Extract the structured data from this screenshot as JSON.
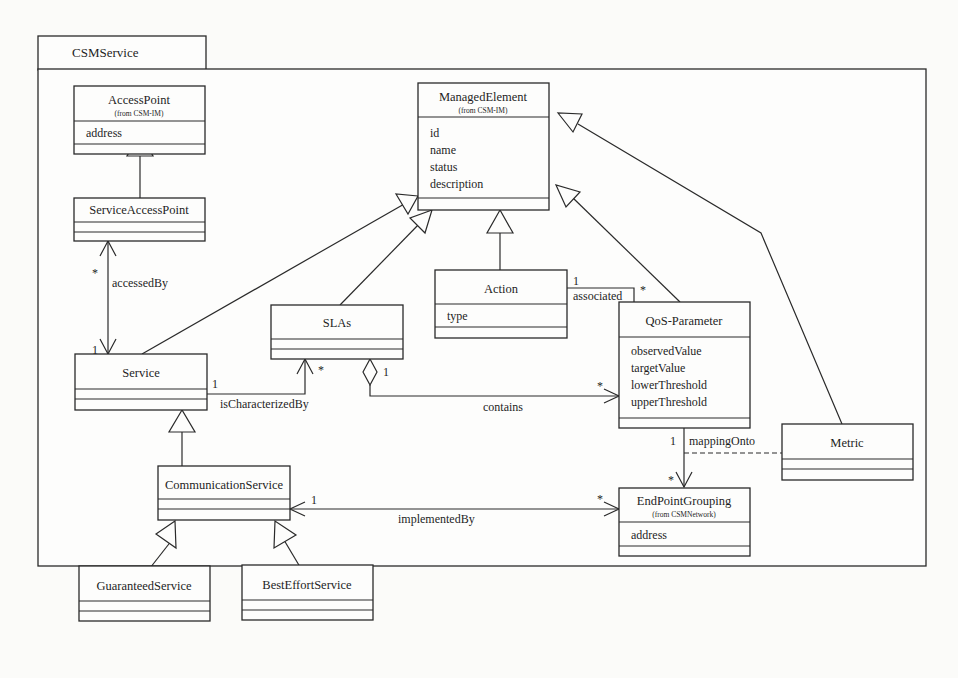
{
  "package": {
    "name": "CSMService"
  },
  "classes": {
    "access_point": {
      "name": "AccessPoint",
      "origin": "(from CSM-IM)",
      "attributes": [
        "address"
      ]
    },
    "service_access_point": {
      "name": "ServiceAccessPoint",
      "attributes": []
    },
    "managed_element": {
      "name": "ManagedElement",
      "origin": "(from CSM-IM)",
      "attributes": [
        "id",
        "name",
        "status",
        "description"
      ]
    },
    "service": {
      "name": "Service",
      "attributes": []
    },
    "slas": {
      "name": "SLAs",
      "attributes": []
    },
    "action": {
      "name": "Action",
      "attributes": [
        "type"
      ]
    },
    "qos_parameter": {
      "name": "QoS-Parameter",
      "attributes": [
        "observedValue",
        "targetValue",
        "lowerThreshold",
        "upperThreshold"
      ]
    },
    "metric": {
      "name": "Metric",
      "attributes": []
    },
    "communication_service": {
      "name": "CommunicationService",
      "attributes": []
    },
    "end_point_grouping": {
      "name": "EndPointGrouping",
      "origin": "(from CSMNetwork)",
      "attributes": [
        "address"
      ]
    },
    "guaranteed_service": {
      "name": "GuaranteedService",
      "attributes": []
    },
    "best_effort_service": {
      "name": "BestEffortService",
      "attributes": []
    }
  },
  "associations": {
    "accessed_by": {
      "label": "accessedBy",
      "source_mult": "*",
      "target_mult": "1"
    },
    "is_characterized_by": {
      "label": "isCharacterizedBy",
      "source_mult": "1",
      "target_mult": "*"
    },
    "contains": {
      "label": "contains",
      "source_mult": "1",
      "target_mult": "*"
    },
    "associated": {
      "label": "associated",
      "source_mult": "1",
      "target_mult": "*"
    },
    "mapping_onto": {
      "label": "mappingOnto",
      "source_mult": "1",
      "target_mult": "*"
    },
    "implemented_by": {
      "label": "implementedBy",
      "source_mult": "1",
      "target_mult": "*"
    }
  },
  "generalizations": [
    {
      "child": "ServiceAccessPoint",
      "parent": "AccessPoint"
    },
    {
      "child": "Service",
      "parent": "ManagedElement"
    },
    {
      "child": "SLAs",
      "parent": "ManagedElement"
    },
    {
      "child": "Action",
      "parent": "ManagedElement"
    },
    {
      "child": "QoS-Parameter",
      "parent": "ManagedElement"
    },
    {
      "child": "Metric",
      "parent": "ManagedElement"
    },
    {
      "child": "CommunicationService",
      "parent": "Service"
    },
    {
      "child": "GuaranteedService",
      "parent": "CommunicationService"
    },
    {
      "child": "BestEffortService",
      "parent": "CommunicationService"
    }
  ]
}
